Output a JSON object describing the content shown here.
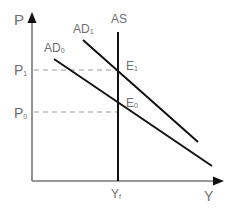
{
  "diagram": {
    "type": "AD-AS model",
    "axes": {
      "y_label": "P",
      "x_label": "Y"
    },
    "curves": {
      "as": {
        "label": "AS",
        "x": 118,
        "y_top": 32,
        "y_bottom": 181
      },
      "ad0": {
        "label": "AD",
        "sub": "0",
        "x1": 54,
        "y1": 59,
        "x2": 212,
        "y2": 166
      },
      "ad1": {
        "label": "AD",
        "sub": "1",
        "x1": 83,
        "y1": 40,
        "x2": 198,
        "y2": 142
      }
    },
    "price_levels": [
      {
        "label": "P",
        "sub": "1",
        "y": 70
      },
      {
        "label": "P",
        "sub": "0",
        "y": 112
      }
    ],
    "equilibria": [
      {
        "label": "E",
        "sub": "1"
      },
      {
        "label": "E",
        "sub": "0"
      }
    ],
    "output_levels": [
      {
        "label": "Y",
        "sub": "f"
      }
    ],
    "colors": {
      "axis": "#777777",
      "curve": "#111111",
      "dashed": "#9a9a9a",
      "text": "#6e6e6e"
    }
  }
}
